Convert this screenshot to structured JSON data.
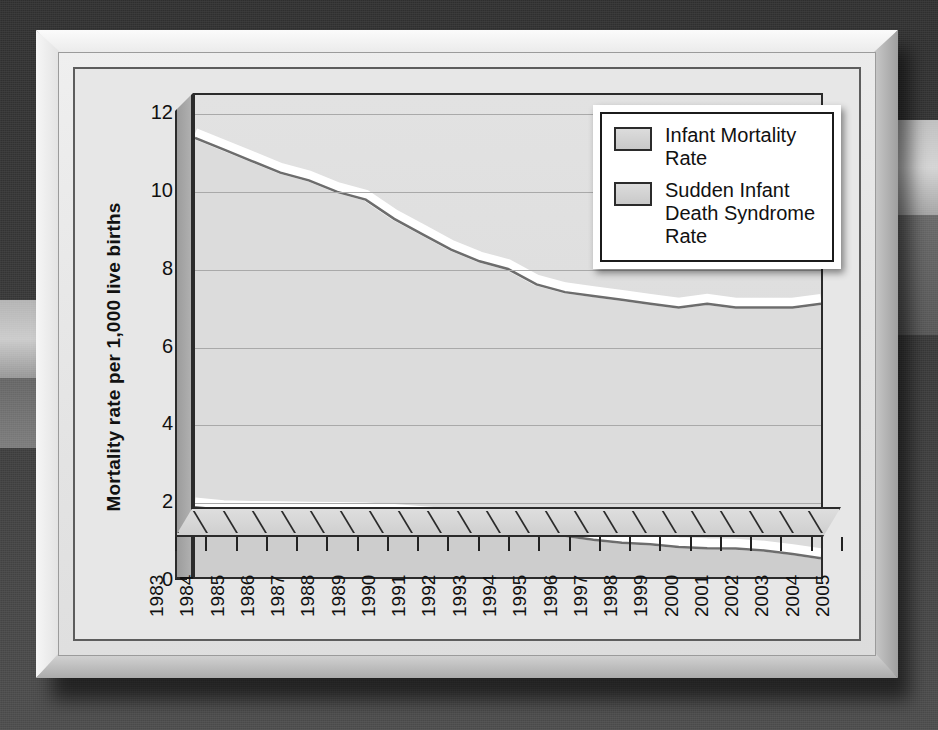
{
  "chart_data": {
    "type": "area",
    "title": "",
    "xlabel": "",
    "ylabel": "Mortality rate per 1,000 live births",
    "ylim": [
      0,
      12.5
    ],
    "yticks": [
      0,
      2,
      4,
      6,
      8,
      10,
      12
    ],
    "grid": true,
    "legend_position": "top-right",
    "categories": [
      "1983",
      "1984",
      "1985",
      "1986",
      "1987",
      "1988",
      "1989",
      "1990",
      "1991",
      "1992",
      "1993",
      "1994",
      "1995",
      "1996",
      "1997",
      "1998",
      "1999",
      "2000",
      "2001",
      "2002",
      "2003",
      "2004",
      "2005"
    ],
    "series": [
      {
        "name": "Infant Mortality Rate",
        "color": "#dcdcdc",
        "values": [
          11.5,
          11.2,
          10.9,
          10.6,
          10.4,
          10.1,
          9.9,
          9.4,
          9.0,
          8.6,
          8.3,
          8.1,
          7.7,
          7.5,
          7.4,
          7.3,
          7.2,
          7.1,
          7.2,
          7.1,
          7.1,
          7.1,
          7.2
        ]
      },
      {
        "name": "Sudden Infant Death Syndrome Rate",
        "color": "#d0d0d0",
        "values": [
          1.92,
          1.85,
          1.83,
          1.82,
          1.81,
          1.8,
          1.79,
          1.75,
          1.69,
          1.64,
          1.45,
          1.38,
          1.24,
          1.18,
          1.08,
          1.0,
          0.96,
          0.89,
          0.86,
          0.85,
          0.8,
          0.71,
          0.6
        ]
      }
    ]
  },
  "yaxis": {
    "title": "Mortality rate per 1,000 live births",
    "tick_labels": [
      "12",
      "10",
      "8",
      "6",
      "4",
      "2",
      "0"
    ]
  },
  "legend": {
    "items": [
      {
        "label": "Infant Mortality Rate"
      },
      {
        "label": "Sudden Infant Death Syndrome Rate"
      }
    ]
  }
}
